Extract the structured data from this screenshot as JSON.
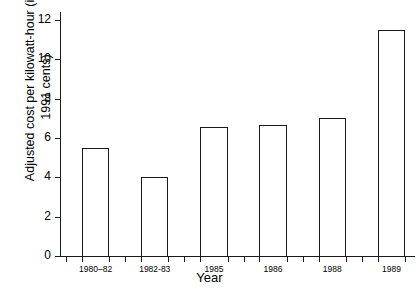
{
  "chart_data": {
    "type": "bar",
    "title": "",
    "xlabel": "Year",
    "ylabel": "Adjusted cost per kilowatt-hour (in\n1991 cents)",
    "categories": [
      "1980–82",
      "1982-83",
      "1985",
      "1986",
      "1988",
      "1989"
    ],
    "values": [
      5.5,
      4.0,
      6.55,
      6.65,
      7.0,
      11.5
    ],
    "ylim": [
      0,
      12
    ],
    "ytick_labels": [
      "0",
      "2",
      "4",
      "6",
      "8",
      "10",
      "12"
    ],
    "ytick_values": [
      0,
      2,
      4,
      6,
      8,
      10,
      12
    ],
    "grid": false,
    "legend": "none",
    "bar_fill_color": "#ffffff",
    "bar_edge_color": "#1a1a1a",
    "axis_color": "#1a1a1a",
    "background_color": "#ffffff"
  }
}
